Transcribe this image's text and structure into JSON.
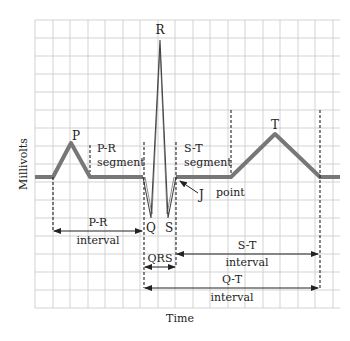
{
  "diagram": {
    "axes": {
      "ylabel": "Millivolts",
      "xlabel": "Time"
    },
    "waves": {
      "p": "P",
      "r": "R",
      "q": "Q",
      "s": "S",
      "t": "T"
    },
    "annotations": {
      "pr_segment_line1": "P-R",
      "pr_segment_line2": "segment",
      "st_segment_line1": "S-T",
      "st_segment_line2": "segment",
      "j_point_letter": "J",
      "j_point_word": "point"
    },
    "intervals": {
      "pr_line1": "P-R",
      "pr_line2": "interval",
      "qrs": "QRS",
      "st_line1": "S-T",
      "st_line2": "interval",
      "qt_line1": "Q-T",
      "qt_line2": "interval"
    },
    "colors": {
      "grid": "#c8c8c8",
      "trace": "#777777",
      "trace_thin": "#444444",
      "annotation": "#222222"
    }
  }
}
